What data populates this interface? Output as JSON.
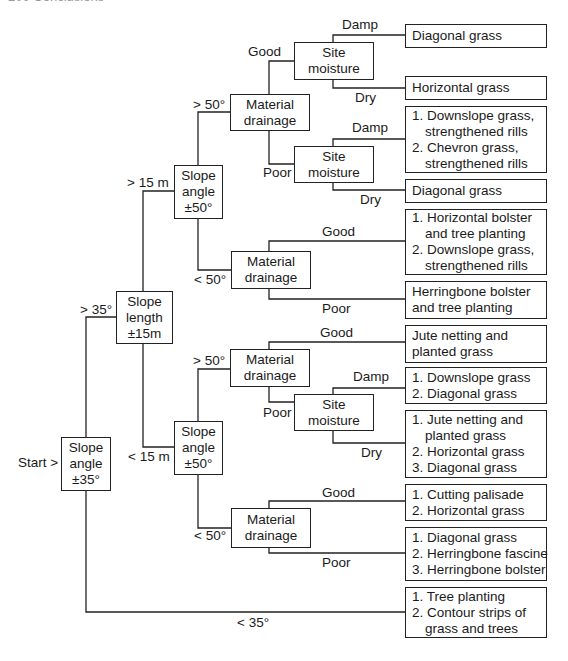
{
  "header_fragment": "200   Conclusions",
  "start_label": "Start >",
  "nodes": {
    "slope_angle_35": [
      "Slope",
      "angle",
      "±35°"
    ],
    "slope_length_15": [
      "Slope",
      "length",
      "±15m"
    ],
    "slope_angle_50_upper": [
      "Slope",
      "angle",
      "±50°"
    ],
    "slope_angle_50_lower": [
      "Slope",
      "angle",
      "±50°"
    ],
    "material_drainage_1": [
      "Material",
      "drainage"
    ],
    "material_drainage_2": [
      "Material",
      "drainage"
    ],
    "material_drainage_3": [
      "Material",
      "drainage"
    ],
    "material_drainage_4": [
      "Material",
      "drainage"
    ],
    "site_moisture_1": [
      "Site",
      "moisture"
    ],
    "site_moisture_2": [
      "Site",
      "moisture"
    ],
    "site_moisture_3": [
      "Site",
      "moisture"
    ]
  },
  "edges": {
    "gt35": "> 35°",
    "lt35": "< 35°",
    "gt15m": "> 15 m",
    "lt15m": "< 15 m",
    "gt50_upper": "> 50°",
    "lt50_upper": "< 50°",
    "gt50_lower": "> 50°",
    "lt50_lower": "< 50°",
    "good_1": "Good",
    "poor_1": "Poor",
    "good_2": "Good",
    "poor_2": "Poor",
    "good_3": "Good",
    "poor_3": "Poor",
    "good_4": "Good",
    "poor_4": "Poor",
    "damp_1": "Damp",
    "dry_1": "Dry",
    "damp_2": "Damp",
    "dry_2": "Dry",
    "damp_3": "Damp",
    "dry_3": "Dry"
  },
  "results": [
    {
      "lines": [
        {
          "t": "Diagonal grass",
          "i": false
        }
      ]
    },
    {
      "lines": [
        {
          "t": "Horizontal grass",
          "i": false
        }
      ]
    },
    {
      "lines": [
        {
          "t": "1. Downslope grass,",
          "i": false
        },
        {
          "t": "strengthened rills",
          "i": true
        },
        {
          "t": "2. Chevron grass,",
          "i": false
        },
        {
          "t": "strengthened rills",
          "i": true
        }
      ]
    },
    {
      "lines": [
        {
          "t": "Diagonal grass",
          "i": false
        }
      ]
    },
    {
      "lines": [
        {
          "t": "1. Horizontal bolster",
          "i": false
        },
        {
          "t": "and tree planting",
          "i": true
        },
        {
          "t": "2. Downslope grass,",
          "i": false
        },
        {
          "t": "strengthened rills",
          "i": true
        }
      ]
    },
    {
      "lines": [
        {
          "t": "Herringbone bolster",
          "i": false
        },
        {
          "t": "and tree planting",
          "i": false
        }
      ]
    },
    {
      "lines": [
        {
          "t": "Jute netting and",
          "i": false
        },
        {
          "t": "planted grass",
          "i": false
        }
      ]
    },
    {
      "lines": [
        {
          "t": "1. Downslope grass",
          "i": false
        },
        {
          "t": "2. Diagonal grass",
          "i": false
        }
      ]
    },
    {
      "lines": [
        {
          "t": "1. Jute netting and",
          "i": false
        },
        {
          "t": "planted grass",
          "i": true
        },
        {
          "t": "2. Horizontal grass",
          "i": false
        },
        {
          "t": "3. Diagonal grass",
          "i": false
        }
      ]
    },
    {
      "lines": [
        {
          "t": "1. Cutting palisade",
          "i": false
        },
        {
          "t": "2. Horizontal grass",
          "i": false
        }
      ]
    },
    {
      "lines": [
        {
          "t": "1. Diagonal grass",
          "i": false
        },
        {
          "t": "2. Herringbone fascine",
          "i": false
        },
        {
          "t": "3. Herringbone bolster",
          "i": false
        }
      ]
    },
    {
      "lines": [
        {
          "t": "1. Tree planting",
          "i": false
        },
        {
          "t": "2. Contour strips of",
          "i": false
        },
        {
          "t": "grass and trees",
          "i": true
        }
      ]
    }
  ],
  "colors": {
    "line": "#222222",
    "text": "#1a1a1a",
    "background": "#ffffff"
  }
}
